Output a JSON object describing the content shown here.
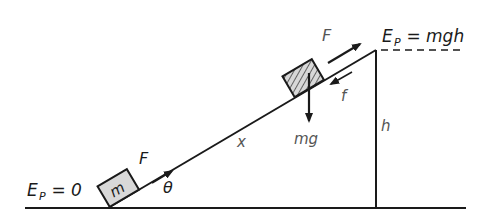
{
  "diagram": {
    "colors": {
      "ink": "#1a1a1a",
      "label_grey": "#555555",
      "hatch": "#444444",
      "block_fill": "#d8d8d8",
      "background": "#ffffff"
    },
    "labels": {
      "ep_bottom": "E",
      "ep_bottom_sub": "P",
      "ep_bottom_rest": " = 0",
      "ep_top": "E",
      "ep_top_sub": "P",
      "ep_top_rest": " = mgh",
      "mass": "m",
      "force_bottom": "F",
      "force_top": "F",
      "friction": "f",
      "weight": "mg",
      "distance": "x",
      "height": "h",
      "angle": "θ"
    },
    "elements": {
      "ground": "horizontal ground line",
      "incline": "inclined plane surface",
      "height_line": "vertical height line",
      "reference_dashed": "dashed top reference line",
      "block_bottom": "block at bottom of incline",
      "block_top": "hatched block near top of incline"
    }
  }
}
